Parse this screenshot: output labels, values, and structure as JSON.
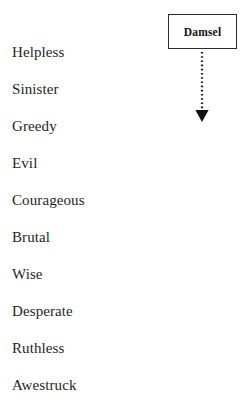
{
  "figure": {
    "background_color": "#ffffff",
    "text_color": "#1f1f1f",
    "line_color": "#2b2b2b"
  },
  "node": {
    "label": "Damsel",
    "border_color": "#2b2b2b",
    "fill_color": "#ffffff"
  },
  "connector": {
    "style": "dotted",
    "direction": "down",
    "arrowhead": "filled-triangle",
    "color": "#1a1a1a"
  },
  "traits": [
    {
      "label": "Helpless",
      "y": 44
    },
    {
      "label": "Sinister",
      "y": 81
    },
    {
      "label": "Greedy",
      "y": 118
    },
    {
      "label": "Evil",
      "y": 155
    },
    {
      "label": "Courageous",
      "y": 192
    },
    {
      "label": "Brutal",
      "y": 229
    },
    {
      "label": "Wise",
      "y": 266
    },
    {
      "label": "Desperate",
      "y": 303
    },
    {
      "label": "Ruthless",
      "y": 340
    },
    {
      "label": "Awestruck",
      "y": 377
    }
  ]
}
